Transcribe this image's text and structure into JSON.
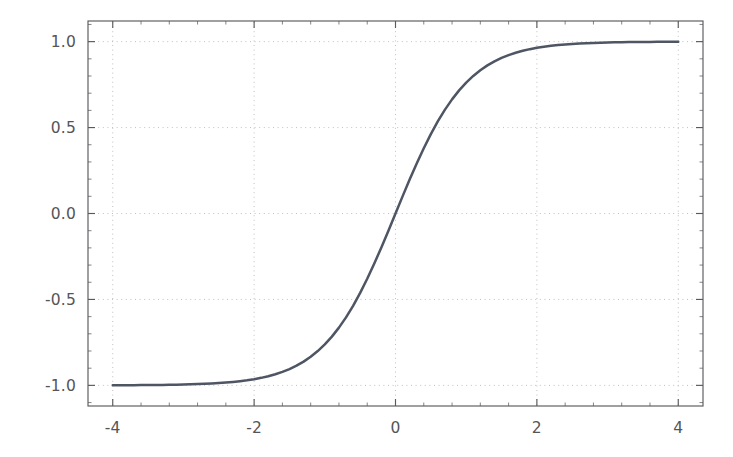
{
  "chart_data": {
    "type": "line",
    "title": "",
    "subtitle": "",
    "xlabel": "",
    "ylabel": "",
    "xlim": [
      -4.35,
      4.35
    ],
    "ylim": [
      -1.12,
      1.12
    ],
    "xticks": [
      -4,
      -2,
      0,
      2,
      4
    ],
    "xtick_labels": [
      "-4",
      "-2",
      "0",
      "2",
      "4"
    ],
    "yticks": [
      1.0,
      0.5,
      0.0,
      -0.5,
      -1.0
    ],
    "ytick_labels": [
      "1.0",
      "0.5",
      "0.0",
      "-0.5",
      "-1.0"
    ],
    "x_minor_tick_step": 0.4,
    "y_minor_tick_step": 0.1,
    "grid": true,
    "grid_style": "dotted",
    "grid_color": "#b9b9bd",
    "legend": null,
    "annotations": [],
    "series": [
      {
        "name": "tanh(x)",
        "color": "#4e5563",
        "linewidth": 2.5,
        "x": [
          -4.0,
          -3.9,
          -3.8,
          -3.7,
          -3.6,
          -3.5,
          -3.4,
          -3.3,
          -3.2,
          -3.1,
          -3.0,
          -2.9,
          -2.8,
          -2.7,
          -2.6,
          -2.5,
          -2.4,
          -2.3,
          -2.2,
          -2.1,
          -2.0,
          -1.9,
          -1.8,
          -1.7,
          -1.6,
          -1.5,
          -1.4,
          -1.3,
          -1.2,
          -1.1,
          -1.0,
          -0.9,
          -0.8,
          -0.7,
          -0.6,
          -0.5,
          -0.4,
          -0.3,
          -0.2,
          -0.1,
          0.0,
          0.1,
          0.2,
          0.3,
          0.4,
          0.5,
          0.6,
          0.7,
          0.8,
          0.9,
          1.0,
          1.1,
          1.2,
          1.3,
          1.4,
          1.5,
          1.6,
          1.7,
          1.8,
          1.9,
          2.0,
          2.1,
          2.2,
          2.3,
          2.4,
          2.5,
          2.6,
          2.7,
          2.8,
          2.9,
          3.0,
          3.1,
          3.2,
          3.3,
          3.4,
          3.5,
          3.6,
          3.7,
          3.8,
          3.9,
          4.0
        ],
        "y": [
          -0.9993,
          -0.9992,
          -0.999,
          -0.9988,
          -0.9985,
          -0.9982,
          -0.9978,
          -0.9973,
          -0.9967,
          -0.9959,
          -0.9951,
          -0.994,
          -0.9926,
          -0.991,
          -0.989,
          -0.9866,
          -0.9837,
          -0.9801,
          -0.9757,
          -0.9705,
          -0.964,
          -0.9562,
          -0.9468,
          -0.9354,
          -0.9217,
          -0.9051,
          -0.8854,
          -0.8617,
          -0.8337,
          -0.8005,
          -0.7616,
          -0.7163,
          -0.664,
          -0.6044,
          -0.537,
          -0.4621,
          -0.3799,
          -0.2913,
          -0.1974,
          -0.0997,
          0.0,
          0.0997,
          0.1974,
          0.2913,
          0.3799,
          0.4621,
          0.537,
          0.6044,
          0.664,
          0.7163,
          0.7616,
          0.8005,
          0.8337,
          0.8617,
          0.8854,
          0.9051,
          0.9217,
          0.9354,
          0.9468,
          0.9562,
          0.964,
          0.9705,
          0.9757,
          0.9801,
          0.9837,
          0.9866,
          0.989,
          0.991,
          0.9926,
          0.994,
          0.9951,
          0.9959,
          0.9967,
          0.9973,
          0.9978,
          0.9982,
          0.9985,
          0.9988,
          0.999,
          0.9992,
          0.9993
        ]
      }
    ]
  },
  "geometry": {
    "plot_left": 88,
    "plot_right": 703,
    "plot_top": 21,
    "plot_bottom": 406
  }
}
